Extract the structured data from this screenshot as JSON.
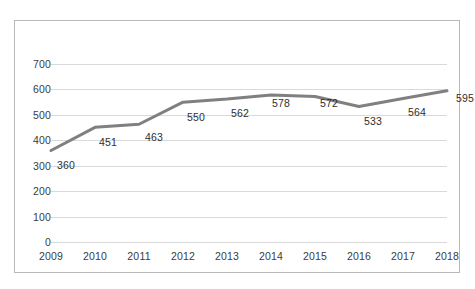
{
  "chart_data": {
    "type": "line",
    "title": "",
    "xlabel": "",
    "ylabel": "",
    "categories": [
      "2009",
      "2010",
      "2011",
      "2012",
      "2013",
      "2014",
      "2015",
      "2016",
      "2017",
      "2018"
    ],
    "values": [
      360,
      451,
      463,
      550,
      562,
      578,
      572,
      533,
      564,
      595
    ],
    "data_labels": [
      "360",
      "451",
      "463",
      "550",
      "562",
      "578",
      "572",
      "533",
      "564",
      "595"
    ],
    "ylim": [
      0,
      700
    ],
    "ytick_values": [
      700,
      600,
      500,
      400,
      300,
      200,
      100,
      0
    ],
    "ytick_labels": [
      "700",
      "600",
      "500",
      "400",
      "300",
      "200",
      "100",
      "0"
    ],
    "grid": true,
    "grid_axis": "y",
    "legend": "none",
    "series": [
      {
        "name": "",
        "values": [
          360,
          451,
          463,
          550,
          562,
          578,
          572,
          533,
          564,
          595
        ],
        "color": "#808080",
        "line_width": 3,
        "markers": false
      }
    ],
    "colors": {
      "line": "#808080",
      "gridline": "#d9d9d9",
      "border": "#b9b9b9",
      "text": "#3b3b3b",
      "background": "#ffffff"
    }
  }
}
